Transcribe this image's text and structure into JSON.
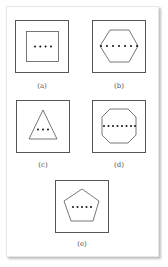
{
  "figures": [
    {
      "id": "a",
      "label": "(a)",
      "shape": "square",
      "dots": 4
    },
    {
      "id": "b",
      "label": "(b)",
      "shape": "hexagon",
      "dots": 7
    },
    {
      "id": "c",
      "label": "(c)",
      "shape": "triangle",
      "dots": 3
    },
    {
      "id": "d",
      "label": "(d)",
      "shape": "octagon",
      "dots": 8
    },
    {
      "id": "e",
      "label": "(e)",
      "shape": "pentagon",
      "dots": 5
    }
  ],
  "colors": {
    "stroke": "#555555",
    "dots": "#111111",
    "background": "#ffffff"
  }
}
